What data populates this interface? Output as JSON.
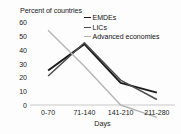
{
  "chart_data": {
    "type": "line",
    "title": "",
    "ylabel": "Percent of countries",
    "xlabel": "Days",
    "categories": [
      "0-70",
      "71-140",
      "141-210",
      "211-280"
    ],
    "ylim": [
      0,
      60
    ],
    "yticks": [
      0,
      10,
      20,
      30,
      40,
      50,
      60
    ],
    "grid": false,
    "legend_position": "top-right",
    "series": [
      {
        "name": "EMDEs",
        "color": "#1a1a1a",
        "width": 1.9,
        "values": [
          25,
          44,
          16,
          9
        ]
      },
      {
        "name": "LICs",
        "color": "#4d4d4d",
        "width": 1.5,
        "values": [
          21,
          45,
          18,
          4
        ]
      },
      {
        "name": "Advanced economies",
        "color": "#b5b5b5",
        "width": 1.4,
        "values": [
          54,
          28,
          0,
          -9
        ]
      }
    ]
  }
}
